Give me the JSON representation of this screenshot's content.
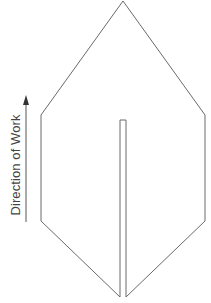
{
  "figure": {
    "caption_clipped": "",
    "direction_label": "Direction of Work",
    "colors": {
      "stroke": "#6a6a6a",
      "arrow": "#555555",
      "label": "#444444",
      "background": "#ffffff"
    },
    "outline": {
      "shape": "hexagonal-pointed-blade",
      "apex": [
        123,
        1
      ],
      "upper_left": [
        41,
        115
      ],
      "lower_left": [
        41,
        221
      ],
      "slit_left_bottom": [
        120,
        297
      ],
      "slit_top": [
        120,
        120,
        126,
        120
      ],
      "slit_right_bottom": [
        126,
        297
      ],
      "lower_right": [
        205,
        221
      ],
      "upper_right": [
        205,
        115
      ]
    },
    "arrow": {
      "direction": "up",
      "x": 26,
      "y_start": 222,
      "y_tip": 96
    }
  }
}
